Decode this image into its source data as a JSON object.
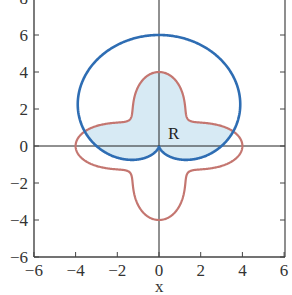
{
  "chart_data": {
    "type": "line",
    "title": "",
    "xlabel": "x",
    "ylabel": "",
    "xlim": [
      -6,
      6
    ],
    "ylim": [
      -6,
      8
    ],
    "x_ticks": [
      -6,
      -4,
      -2,
      0,
      2,
      4,
      6
    ],
    "y_ticks": [
      -6,
      -4,
      -2,
      0,
      2,
      4,
      6,
      8
    ],
    "x_tick_labels": [
      "−6",
      "−4",
      "−2",
      "0",
      "2",
      "4",
      "6"
    ],
    "y_tick_labels": [
      "−6",
      "−4",
      "−2",
      "0",
      "2",
      "4",
      "6",
      "8"
    ],
    "grid": false,
    "legend": null,
    "series": [
      {
        "name": "cardioid",
        "kind": "polar",
        "equation": "r = 3 + 3 sin(theta)",
        "color": "#2e6db3",
        "key_points": [
          [
            0,
            6
          ],
          [
            3.9,
            2.25
          ],
          [
            3,
            0
          ],
          [
            0,
            0
          ],
          [
            -3,
            0
          ],
          [
            -3.9,
            2.25
          ]
        ]
      },
      {
        "name": "four-petal rose",
        "kind": "polar",
        "equation": "r = 3 + cos(4 theta)",
        "color": "#c47670",
        "key_points": [
          [
            4,
            0
          ],
          [
            1.41,
            1.41
          ],
          [
            0,
            4
          ],
          [
            -1.41,
            1.41
          ],
          [
            -4,
            0
          ],
          [
            -1.41,
            -1.41
          ],
          [
            0,
            -4
          ],
          [
            1.41,
            -1.41
          ]
        ]
      }
    ],
    "annotations": [
      {
        "text": "R",
        "x": 0.8,
        "y": 0.7,
        "description": "shaded region inside both curves"
      }
    ],
    "shaded_region": {
      "label": "R",
      "description": "intersection of interiors of both curves",
      "color": "#d7eaf4"
    }
  },
  "labels": {
    "xlabel": "x",
    "region": "R"
  }
}
